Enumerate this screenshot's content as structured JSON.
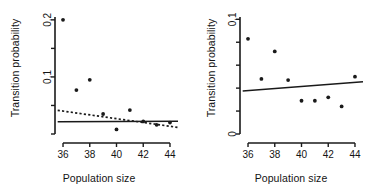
{
  "figure": {
    "panels": [
      {
        "id": "left",
        "xlabel": "Population size",
        "ylabel": "Transition probability"
      },
      {
        "id": "right",
        "xlabel": "Population size",
        "ylabel": "Transition probability"
      }
    ]
  },
  "chart_data": [
    {
      "type": "scatter",
      "panel": "left",
      "title": "",
      "xlabel": "Population size",
      "ylabel": "Transition probability",
      "xlim": [
        35.4,
        44.6
      ],
      "ylim": [
        0,
        0.205
      ],
      "xticks": [
        36,
        38,
        40,
        42,
        44
      ],
      "xtick_labels": [
        "36",
        "38",
        "40",
        "42",
        "44"
      ],
      "yticks": [
        0,
        0.05,
        0.1,
        0.15,
        0.2
      ],
      "ytick_labels": [
        "",
        "",
        "0.1",
        "",
        "0.2"
      ],
      "grid": false,
      "legend": "none",
      "x": [
        36,
        37,
        38,
        39,
        40,
        41,
        42,
        43,
        44
      ],
      "y": [
        0.2,
        0.077,
        0.095,
        0.035,
        0.008,
        0.042,
        0.022,
        0.016,
        0.02
      ],
      "series": [
        {
          "name": "observed transition probability",
          "values": [
            0.2,
            0.077,
            0.095,
            0.035,
            0.008,
            0.042,
            0.022,
            0.016,
            0.02
          ]
        }
      ],
      "annotations": [
        {
          "name": "dashed-regression-line",
          "style": "dashed",
          "x": [
            35.6,
            44.6
          ],
          "y": [
            0.0415,
            0.0115
          ]
        },
        {
          "name": "solid-regression-line",
          "style": "solid",
          "x": [
            35.6,
            44.6
          ],
          "y": [
            0.0215,
            0.0225
          ]
        }
      ]
    },
    {
      "type": "scatter",
      "panel": "right",
      "title": "",
      "xlabel": "Population size",
      "ylabel": "Transition probability",
      "xlim": [
        35.4,
        44.6
      ],
      "ylim": [
        0,
        0.102
      ],
      "xticks": [
        36,
        38,
        40,
        42,
        44
      ],
      "xtick_labels": [
        "36",
        "38",
        "40",
        "42",
        "44"
      ],
      "yticks": [
        0,
        0.02,
        0.04,
        0.06,
        0.08,
        0.1
      ],
      "ytick_labels": [
        "0",
        "",
        "",
        "",
        "",
        "0.1"
      ],
      "grid": false,
      "legend": "none",
      "x": [
        36,
        37,
        38,
        39,
        40,
        41,
        42,
        43,
        44
      ],
      "y": [
        0.083,
        0.048,
        0.072,
        0.047,
        0.029,
        0.029,
        0.032,
        0.024,
        0.05
      ],
      "series": [
        {
          "name": "observed transition probability",
          "values": [
            0.083,
            0.048,
            0.072,
            0.047,
            0.029,
            0.029,
            0.032,
            0.024,
            0.05
          ]
        }
      ],
      "annotations": [
        {
          "name": "solid-regression-line",
          "style": "solid",
          "x": [
            35.6,
            44.6
          ],
          "y": [
            0.0375,
            0.0455
          ]
        }
      ]
    }
  ]
}
